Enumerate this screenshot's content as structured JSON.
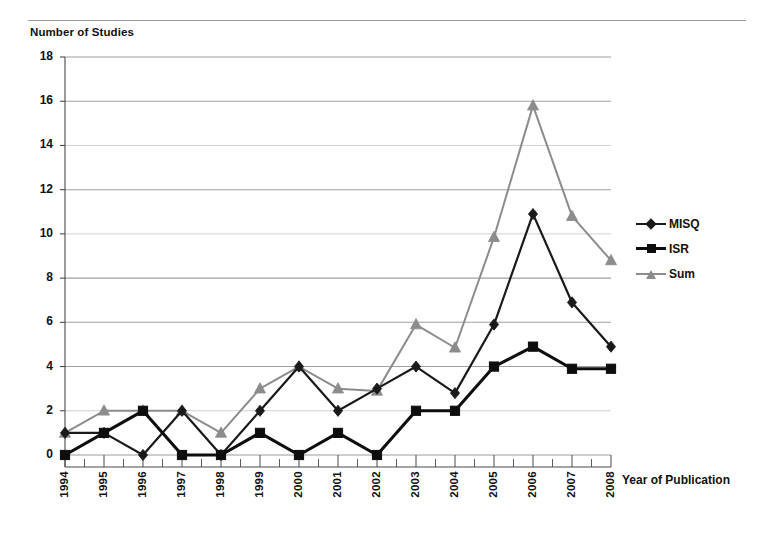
{
  "figure": {
    "y_axis_title": "Number of Studies",
    "x_axis_title": "Year of Publication",
    "caption": ""
  },
  "legend": {
    "position": "right",
    "entries": [
      {
        "label": "MISQ",
        "marker": "diamond-marker",
        "color": "#1a1a1a"
      },
      {
        "label": "ISR",
        "marker": "square-marker",
        "color": "#0d0d0d"
      },
      {
        "label": "Sum",
        "marker": "triangle-marker",
        "color": "#8c8c8c"
      }
    ]
  },
  "chart_data": {
    "type": "line",
    "title": "",
    "subtitle": "",
    "xlabel": "Year of Publication",
    "ylabel": "Number of Studies",
    "categories": [
      "1994",
      "1995",
      "1996",
      "1997",
      "1998",
      "1999",
      "2000",
      "2001",
      "2002",
      "2003",
      "2004",
      "2005",
      "2006",
      "2007",
      "2008"
    ],
    "x": [
      1994,
      1995,
      1996,
      1997,
      1998,
      1999,
      2000,
      2001,
      2002,
      2003,
      2004,
      2005,
      2006,
      2007,
      2008
    ],
    "series": [
      {
        "name": "MISQ",
        "marker": "diamond",
        "color": "#1a1a1a",
        "values": [
          1,
          1,
          0,
          2,
          0,
          2,
          4,
          2,
          3,
          4,
          2.8,
          5.9,
          10.9,
          6.9,
          4.9
        ]
      },
      {
        "name": "ISR",
        "marker": "square",
        "color": "#0d0d0d",
        "values": [
          0,
          1,
          2,
          0,
          0,
          1,
          0,
          1,
          0,
          2,
          2,
          4,
          4.9,
          3.9,
          3.9
        ]
      },
      {
        "name": "Sum",
        "marker": "triangle",
        "color": "#8c8c8c",
        "values": [
          1,
          2,
          2,
          2,
          1,
          3,
          4,
          3,
          2.9,
          5.9,
          4.85,
          9.85,
          15.8,
          10.8,
          8.8
        ]
      }
    ],
    "yticks": [
      0,
      2,
      4,
      6,
      8,
      10,
      12,
      14,
      16,
      18
    ],
    "ylim": [
      0,
      18
    ],
    "grid": true,
    "grid_axis": "y",
    "legend_position": "right"
  },
  "colors": {
    "grid": "#9c9c9c",
    "axis": "#4a4a4a",
    "series_misq": "#1a1a1a",
    "series_isr": "#0d0d0d",
    "series_sum": "#8c8c8c",
    "background": "#ffffff"
  }
}
